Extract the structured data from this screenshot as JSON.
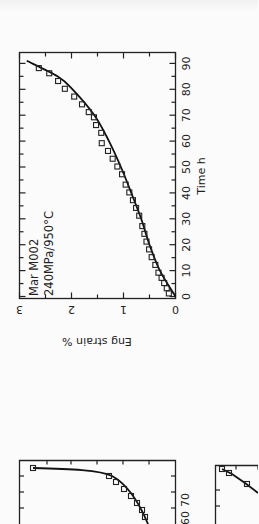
{
  "chart_data": [
    {
      "type": "scatter",
      "orientation": "rotated-90-ccw",
      "title": "",
      "annotations": [
        "Mar M002",
        "240MPa/950°C"
      ],
      "xlabel": "Time h",
      "ylabel": "Eng strain %",
      "xlim": [
        0,
        92
      ],
      "ylim": [
        0,
        3
      ],
      "x_ticks": [
        0,
        10,
        20,
        30,
        40,
        50,
        60,
        70,
        80,
        90
      ],
      "y_ticks": [
        0,
        1,
        2,
        3
      ],
      "grid": false,
      "legend": null,
      "series": [
        {
          "name": "measured",
          "marker": "open-square",
          "x": [
            1,
            3,
            5,
            7,
            9,
            12,
            15,
            18,
            21,
            24,
            27,
            31,
            34,
            37,
            40,
            43,
            47,
            50,
            53,
            56,
            59,
            63,
            66,
            69,
            71,
            74,
            77,
            80,
            83,
            86,
            88
          ],
          "y": [
            0.08,
            0.12,
            0.17,
            0.22,
            0.28,
            0.34,
            0.41,
            0.46,
            0.51,
            0.55,
            0.59,
            0.65,
            0.71,
            0.77,
            0.84,
            0.91,
            0.98,
            1.07,
            1.16,
            1.25,
            1.37,
            1.38,
            1.48,
            1.52,
            1.62,
            1.75,
            1.9,
            2.08,
            2.21,
            2.38,
            2.58
          ]
        },
        {
          "name": "model fit",
          "style": "solid-line",
          "x": [
            0,
            10,
            20,
            30,
            40,
            50,
            60,
            70,
            80,
            85,
            91
          ],
          "y": [
            0,
            0.3,
            0.5,
            0.66,
            0.85,
            1.05,
            1.28,
            1.56,
            1.98,
            2.27,
            2.86
          ]
        }
      ]
    },
    {
      "type": "scatter",
      "partial": true,
      "x_ticks_visible": [
        60,
        70
      ],
      "series": [
        {
          "name": "measured",
          "marker": "open-square"
        },
        {
          "name": "model fit",
          "style": "solid-line"
        }
      ]
    },
    {
      "type": "scatter",
      "partial": true,
      "x_ticks_visible": [
        70
      ],
      "series": [
        {
          "name": "measured",
          "marker": "open-square"
        },
        {
          "name": "model fit",
          "style": "solid-line"
        }
      ]
    }
  ],
  "labels": {
    "annot1": "Mar M002",
    "annot2": "240MPa/950°C",
    "xlabel": "Time h",
    "ylabel": "Eng strain %",
    "xt": [
      "0",
      "10",
      "20",
      "30",
      "40",
      "50",
      "60",
      "70",
      "80",
      "90"
    ],
    "yt": [
      "0",
      "1",
      "2",
      "3"
    ],
    "b1": [
      "60",
      "70"
    ],
    "b2": [
      "70"
    ]
  }
}
